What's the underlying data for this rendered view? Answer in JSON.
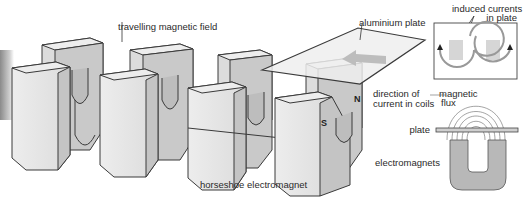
{
  "diagram": {
    "labels": {
      "travelling_field": "travelling magnetic field",
      "aluminium_plate": "aluminium plate",
      "direction_line1": "direction of",
      "direction_line2": "current in coils",
      "horseshoe": "horseshoe electromagnet",
      "induced_line1": "induced currents",
      "induced_line2": "in plate",
      "magnetic_line1": "magnetic",
      "magnetic_line2": "flux",
      "plate": "plate",
      "electromagnets": "electromagnets"
    },
    "poles": {
      "north": "N",
      "south": "S"
    },
    "icons": {
      "plate_motion": "arrow-left-icon",
      "eddy_current": "circular-arrow-icon"
    },
    "colors": {
      "background": "#ffffff",
      "magnet_face": "#e4e4e4",
      "magnet_side": "#c4c4c4",
      "magnet_top": "#ededed",
      "outline": "#3a3a3a",
      "plate": "#eeeeee",
      "arrow": "#bdbdbd",
      "inset_magnet": "#b8b8b8"
    }
  }
}
